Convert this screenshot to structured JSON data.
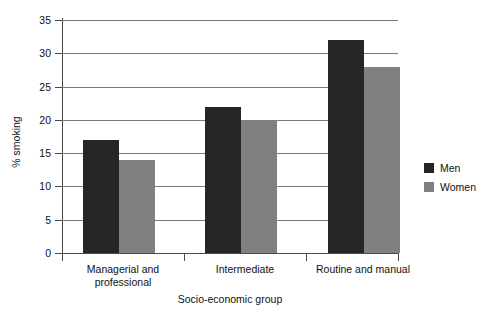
{
  "chart_data": {
    "type": "bar",
    "title": "",
    "subtitle": "",
    "xlabel": "Socio-economic group",
    "ylabel": "% smoking",
    "categories": [
      "Managerial and professional",
      "Intermediate",
      "Routine and manual"
    ],
    "category_lines": [
      [
        "Managerial and",
        "professional"
      ],
      [
        "Intermediate"
      ],
      [
        "Routine and manual"
      ]
    ],
    "series": [
      {
        "name": "Men",
        "color": "#262626",
        "values": [
          17,
          22,
          32
        ]
      },
      {
        "name": "Women",
        "color": "#808080",
        "values": [
          14,
          20,
          28
        ]
      }
    ],
    "ylim": [
      0,
      35
    ],
    "yticks": [
      0,
      5,
      10,
      15,
      20,
      25,
      30,
      35
    ],
    "ytick_labels": [
      "0",
      "5",
      "10",
      "15",
      "20",
      "25",
      "30",
      "35"
    ],
    "grid": true,
    "grid_axis": "y",
    "legend_position": "right",
    "legend": [
      "Men",
      "Women"
    ]
  }
}
